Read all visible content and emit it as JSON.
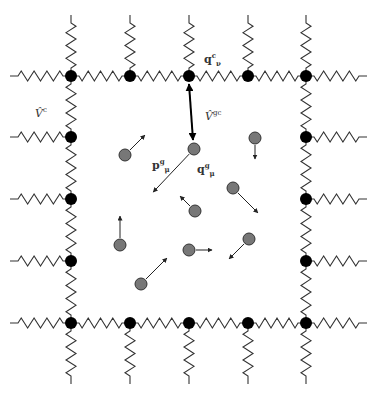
{
  "figure": {
    "labels": {
      "cage_potential": {
        "base": "V̂",
        "sup": "c"
      },
      "guest_cage_potential": {
        "base": "V̂",
        "sup": "gc"
      },
      "cage_node_position": {
        "base": "q",
        "sup": "c",
        "sub": "ν"
      },
      "guest_momentum": {
        "base": "p",
        "sup": "g",
        "sub": "μ"
      },
      "guest_position": {
        "base": "q",
        "sup": "g",
        "sub": "μ"
      }
    },
    "colors": {
      "node": "#000000",
      "particle": "#777777",
      "particle_stroke": "#333333",
      "spring": "#333333"
    },
    "grid": {
      "columns_x": [
        71,
        130,
        189,
        248,
        306
      ],
      "rows_y": [
        76,
        137,
        199,
        261,
        323
      ]
    },
    "particles": [
      {
        "x": 125,
        "y": 155,
        "dx": 15,
        "dy": -15
      },
      {
        "x": 194,
        "y": 149,
        "dx": -36,
        "dy": 38
      },
      {
        "x": 255,
        "y": 138,
        "dx": 0,
        "dy": 14
      },
      {
        "x": 233,
        "y": 188,
        "dx": 20,
        "dy": 20
      },
      {
        "x": 195,
        "y": 211,
        "dx": -10,
        "dy": -10
      },
      {
        "x": 120,
        "y": 245,
        "dx": 0,
        "dy": -22
      },
      {
        "x": 189,
        "y": 250,
        "dx": 16,
        "dy": 0
      },
      {
        "x": 249,
        "y": 239,
        "dx": -15,
        "dy": 15
      },
      {
        "x": 141,
        "y": 284,
        "dx": 21,
        "dy": -21
      }
    ]
  }
}
